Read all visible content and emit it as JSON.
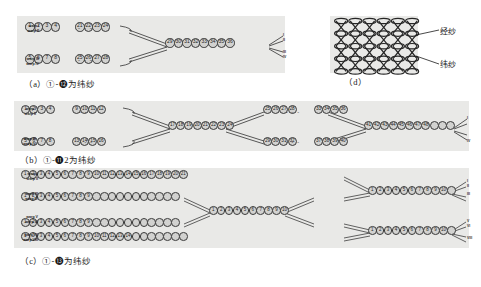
{
  "figure": {
    "kind": "textile-weave-yarn-path-diagram",
    "background": "#ffffff",
    "panel_fill": "#e9e9e7",
    "bead_fill": "#d2d2d0",
    "bead_stroke": "#3a3a3a",
    "line_color": "#3c3c3c"
  },
  "panels": {
    "a": {
      "id": "a",
      "caption": "（a）①-⓬为纬纱",
      "caption_label": "(a)",
      "range_start": "①",
      "range_end": "㎡",
      "range_end_text": "56",
      "caption_tail": "为纬纱",
      "rect": {
        "x": 17,
        "y": 16,
        "w": 268,
        "h": 57
      },
      "warp_rows": 4,
      "warp_labels": [
        "warp I",
        "warp II",
        "warp III",
        "warp IV"
      ],
      "end_labels": [
        "I",
        "II",
        "III",
        "IV"
      ],
      "branches": 2,
      "left_group_counts": [
        4,
        4
      ],
      "trunk_count": 8,
      "dots_text": "- - -"
    },
    "b": {
      "id": "b",
      "caption": "（b）①-⓫2为纬纱",
      "caption_label": "(b)",
      "range_start": "①",
      "range_end": "⑫",
      "range_end_text": "112",
      "caption_tail": "为纬纱",
      "rect": {
        "x": 14,
        "y": 101,
        "w": 455,
        "h": 50
      },
      "warp_rows": 4,
      "warp_labels": [
        "warp I",
        "warp II",
        "warp III",
        "warp IV"
      ],
      "end_labels": [
        "I",
        "II",
        "III",
        "IV"
      ],
      "branches": 2,
      "left_group_counts": [
        4,
        4
      ],
      "trunk_count": 8,
      "dots_text": "- - -"
    },
    "c": {
      "id": "c",
      "caption": "（c）①-⓭为纬纱",
      "caption_label": "(c)",
      "range_start": "①",
      "range_end": "⓭",
      "range_end_text": "104",
      "caption_tail": "为纬纱",
      "rect": {
        "x": 14,
        "y": 168,
        "w": 455,
        "h": 80
      },
      "warp_rows": 8,
      "warp_labels": [
        "warp I",
        "warp II",
        "warp III",
        "warp IV",
        "warp V",
        "warp VI",
        "warp VII",
        "warp VIII"
      ],
      "end_labels": [
        "I",
        "II",
        "III",
        "IV",
        "V",
        "VI",
        "VII",
        "VIII"
      ],
      "branches": 4,
      "trunk_count": 10,
      "dots_text": "- - -"
    },
    "d": {
      "id": "d",
      "caption": "（d）",
      "caption_label": "(d)",
      "rect": {
        "x": 330,
        "y": 16,
        "w": 88,
        "h": 57
      },
      "mesh_cols": 6,
      "mesh_rows": 4,
      "annotations": [
        {
          "name": "warp-yarn",
          "text": "经纱",
          "pinyin": "jingsha"
        },
        {
          "name": "weft-yarn",
          "text": "纬纱",
          "pinyin": "weisha"
        }
      ]
    }
  },
  "bead_numbers": {
    "panel_a_top_left": [
      "1",
      "2",
      "3",
      "4"
    ],
    "panel_a_top_right": [
      "21",
      "22",
      "23",
      "24"
    ],
    "panel_a_bottom_left": [
      "5",
      "6",
      "7",
      "8"
    ],
    "panel_a_bottom_right": [
      "25",
      "26",
      "27",
      "28"
    ],
    "panel_a_trunk": [
      "29",
      "30",
      "31",
      "32",
      "33",
      "34",
      "35",
      "36"
    ],
    "panel_b_top_left": [
      "1",
      "2",
      "3",
      "4"
    ],
    "panel_b_top_mid": [
      "9",
      "10",
      "11",
      "12"
    ],
    "panel_b_bottom_left": [
      "5",
      "6",
      "7",
      "8"
    ],
    "panel_b_bottom_mid": [
      "13",
      "14",
      "15",
      "16"
    ],
    "panel_b_trunk1": [
      "17",
      "18",
      "19",
      "20",
      "21",
      "22",
      "23",
      "24"
    ],
    "panel_b_top_left2": [
      "25",
      "26",
      "27",
      "28"
    ],
    "panel_b_top_right2": [
      "33",
      "34",
      "35",
      "36"
    ],
    "panel_b_bottom_left2": [
      "29",
      "30",
      "31",
      "32"
    ],
    "panel_b_bottom_right2": [
      "37",
      "38",
      "39",
      "40"
    ],
    "panel_b_trunk2": [
      "41",
      "42",
      "43",
      "44",
      "45",
      "46",
      "47",
      "48"
    ],
    "panel_c_row1": [
      "1",
      "2",
      "3",
      "4",
      "5",
      "6",
      "7",
      "8",
      "9",
      "10",
      "11",
      "12",
      "13",
      "14",
      "15",
      "16",
      "17",
      "18",
      "19",
      "20",
      "21",
      "22",
      "23",
      "24",
      "25",
      "26"
    ],
    "panel_c_row2": [
      "1",
      "2",
      "3",
      "4",
      "5",
      "6",
      "7",
      "8",
      "9"
    ],
    "panel_c_row3": [
      "1",
      "2",
      "3",
      "4",
      "5",
      "6",
      "7",
      "8",
      "9"
    ],
    "panel_c_row4": [
      "1",
      "2",
      "3",
      "4",
      "5",
      "6",
      "7",
      "8",
      "9",
      "10",
      "11",
      "12",
      "13",
      "14"
    ],
    "panel_c_trunk_top": [
      "1",
      "2",
      "3",
      "4",
      "5",
      "6",
      "7",
      "8",
      "9",
      "10"
    ],
    "panel_c_trunk_bot": [
      "1",
      "2",
      "3",
      "4",
      "5",
      "6",
      "7",
      "8",
      "9",
      "10"
    ],
    "panel_c_right_top": [
      "1",
      "2",
      "3",
      "4",
      "5",
      "6",
      "7",
      "8",
      "9",
      "10"
    ],
    "panel_c_right_bot": [
      "1",
      "2",
      "3",
      "4",
      "5",
      "6",
      "7",
      "8",
      "9",
      "10"
    ]
  }
}
